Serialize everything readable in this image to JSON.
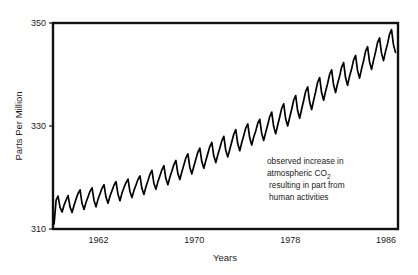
{
  "chart_data": {
    "type": "line",
    "title": "",
    "subtitle": "",
    "xlabel": "Years",
    "ylabel": "Parts Per Million",
    "xlim": [
      1958.2,
      1987.0
    ],
    "ylim": [
      310,
      350
    ],
    "grid": false,
    "legend": null,
    "xticks": [
      1962,
      1970,
      1978,
      1986
    ],
    "xtick_labels": [
      "1962",
      "1970",
      "1978",
      "1986"
    ],
    "yticks": [
      310,
      330,
      350
    ],
    "ytick_labels": [
      "310",
      "330",
      "350"
    ],
    "annotations": [
      {
        "name": "co2-annotation",
        "lines": [
          "observed increase in",
          "atmospheric CO",
          "resulting in part from",
          "human activities"
        ],
        "subscript": "2",
        "x": 1977.0,
        "y": 324.5
      }
    ],
    "series": [
      {
        "name": "Atmospheric CO2 concentration (Mauna Loa)",
        "color": "#000000",
        "x": [
          1958.29,
          1958.46,
          1958.62,
          1958.79,
          1958.96,
          1959.12,
          1959.29,
          1959.46,
          1959.62,
          1959.79,
          1959.96,
          1960.12,
          1960.29,
          1960.46,
          1960.62,
          1960.79,
          1960.96,
          1961.12,
          1961.29,
          1961.46,
          1961.62,
          1961.79,
          1961.96,
          1962.12,
          1962.29,
          1962.46,
          1962.62,
          1962.79,
          1962.96,
          1963.12,
          1963.29,
          1963.46,
          1963.62,
          1963.79,
          1963.96,
          1964.12,
          1964.29,
          1964.46,
          1964.62,
          1964.79,
          1964.96,
          1965.12,
          1965.29,
          1965.46,
          1965.62,
          1965.79,
          1965.96,
          1966.12,
          1966.29,
          1966.46,
          1966.62,
          1966.79,
          1966.96,
          1967.12,
          1967.29,
          1967.46,
          1967.62,
          1967.79,
          1967.96,
          1968.12,
          1968.29,
          1968.46,
          1968.62,
          1968.79,
          1968.96,
          1969.12,
          1969.29,
          1969.46,
          1969.62,
          1969.79,
          1969.96,
          1970.12,
          1970.29,
          1970.46,
          1970.62,
          1970.79,
          1970.96,
          1971.12,
          1971.29,
          1971.46,
          1971.62,
          1971.79,
          1971.96,
          1972.12,
          1972.29,
          1972.46,
          1972.62,
          1972.79,
          1972.96,
          1973.12,
          1973.29,
          1973.46,
          1973.62,
          1973.79,
          1973.96,
          1974.12,
          1974.29,
          1974.46,
          1974.62,
          1974.79,
          1974.96,
          1975.12,
          1975.29,
          1975.46,
          1975.62,
          1975.79,
          1975.96,
          1976.12,
          1976.29,
          1976.46,
          1976.62,
          1976.79,
          1976.96,
          1977.12,
          1977.29,
          1977.46,
          1977.62,
          1977.79,
          1977.96,
          1978.12,
          1978.29,
          1978.46,
          1978.62,
          1978.79,
          1978.96,
          1979.12,
          1979.29,
          1979.46,
          1979.62,
          1979.79,
          1979.96,
          1980.12,
          1980.29,
          1980.46,
          1980.62,
          1980.79,
          1980.96,
          1981.12,
          1981.29,
          1981.46,
          1981.62,
          1981.79,
          1981.96,
          1982.12,
          1982.29,
          1982.46,
          1982.62,
          1982.79,
          1982.96,
          1983.12,
          1983.29,
          1983.46,
          1983.62,
          1983.79,
          1983.96,
          1984.12,
          1984.29,
          1984.46,
          1984.62,
          1984.79,
          1984.96,
          1985.12,
          1985.29,
          1985.46,
          1985.62,
          1985.79,
          1985.96,
          1986.12,
          1986.29,
          1986.46,
          1986.62,
          1986.79
        ],
        "y": [
          311.0,
          315.6,
          316.4,
          314.2,
          313.3,
          314.6,
          315.6,
          316.5,
          314.3,
          313.2,
          314.6,
          315.8,
          316.9,
          317.6,
          315.0,
          313.8,
          315.2,
          316.2,
          317.3,
          318.0,
          315.6,
          314.3,
          315.8,
          316.8,
          317.9,
          318.6,
          316.2,
          315.0,
          316.4,
          317.4,
          318.5,
          319.2,
          316.8,
          315.5,
          317.0,
          318.0,
          319.0,
          319.7,
          317.3,
          316.1,
          317.5,
          318.5,
          319.6,
          320.3,
          317.9,
          316.7,
          318.2,
          319.3,
          320.6,
          321.4,
          318.9,
          317.7,
          319.2,
          320.3,
          321.5,
          322.3,
          319.8,
          318.6,
          320.1,
          321.2,
          322.5,
          323.3,
          320.8,
          319.6,
          321.1,
          322.4,
          323.8,
          324.6,
          322.0,
          320.7,
          322.2,
          323.5,
          324.9,
          325.7,
          323.1,
          321.8,
          323.3,
          324.6,
          326.0,
          326.8,
          324.2,
          322.9,
          324.4,
          325.7,
          327.1,
          328.0,
          325.3,
          324.0,
          325.5,
          326.9,
          328.4,
          329.3,
          326.6,
          325.2,
          326.8,
          328.1,
          329.6,
          330.4,
          327.7,
          326.3,
          327.9,
          329.0,
          330.5,
          331.3,
          328.6,
          327.2,
          328.8,
          330.2,
          331.8,
          332.7,
          329.9,
          328.5,
          330.2,
          331.7,
          333.4,
          334.3,
          331.4,
          330.0,
          331.7,
          333.2,
          335.0,
          335.9,
          333.0,
          331.5,
          333.3,
          334.9,
          336.7,
          337.6,
          334.7,
          333.2,
          335.0,
          336.6,
          338.5,
          339.4,
          336.5,
          335.0,
          336.8,
          338.2,
          340.0,
          340.9,
          338.0,
          336.5,
          338.3,
          339.6,
          341.4,
          342.3,
          339.4,
          337.9,
          339.7,
          341.0,
          342.8,
          343.7,
          340.8,
          339.3,
          341.1,
          342.6,
          344.5,
          345.4,
          342.5,
          341.0,
          342.8,
          344.3,
          346.2,
          347.1,
          344.2,
          342.7,
          344.5,
          345.9,
          347.8,
          348.7,
          345.8,
          344.3
        ]
      }
    ]
  }
}
